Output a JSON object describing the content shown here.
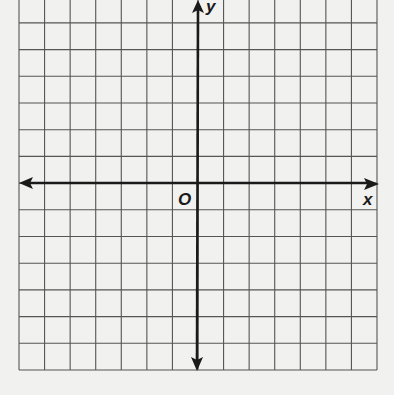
{
  "graph": {
    "x_axis_label": "x",
    "y_axis_label": "y",
    "origin_label": "O",
    "columns": 14,
    "rows": 14,
    "grid_color": "#555555",
    "axis_color": "#1a1a1a"
  }
}
